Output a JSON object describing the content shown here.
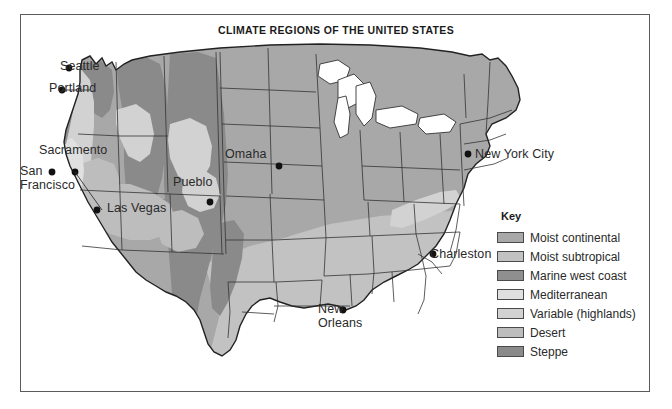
{
  "figure": {
    "title": "CLIMATE REGIONS OF THE UNITED STATES"
  },
  "legend": {
    "title": "Key",
    "items": [
      {
        "label": "Moist continental",
        "color": "#a8a8a8"
      },
      {
        "label": "Moist subtropical",
        "color": "#c2c2c2"
      },
      {
        "label": "Marine west coast",
        "color": "#8f8f8f"
      },
      {
        "label": "Mediterranean",
        "color": "#e0e0e0"
      },
      {
        "label": "Variable (highlands)",
        "color": "#d2d2d2"
      },
      {
        "label": "Desert",
        "color": "#bdbdbd"
      },
      {
        "label": "Steppe",
        "color": "#8a8a8a"
      }
    ]
  },
  "map": {
    "ocean_color": "#ffffff",
    "state_border_color": "#333333",
    "city_dot_color": "#111111",
    "cities": [
      {
        "name": "Seattle",
        "label": "Seattle",
        "label_x": 40,
        "label_y": 60,
        "dot_x": 49,
        "dot_y": 54
      },
      {
        "name": "Portland",
        "label": "Portland",
        "label_x": 29,
        "label_y": 82,
        "dot_x": 42,
        "dot_y": 76
      },
      {
        "name": "Sacramento",
        "label": "Sacramento",
        "label_x": 19,
        "label_y": 144,
        "dot_x": 55,
        "dot_y": 158
      },
      {
        "name": "San Francisco",
        "label": "San\nFrancisco",
        "label_x": 0,
        "label_y": 164,
        "dot_x": 32,
        "dot_y": 158
      },
      {
        "name": "Las Vegas",
        "label": "Las Vegas",
        "label_x": 87,
        "label_y": 202,
        "dot_x": 77,
        "dot_y": 196
      },
      {
        "name": "Pueblo",
        "label": "Pueblo",
        "label_x": 153,
        "label_y": 176,
        "dot_x": 190,
        "dot_y": 188
      },
      {
        "name": "Omaha",
        "label": "Omaha",
        "label_x": 205,
        "label_y": 148,
        "dot_x": 259,
        "dot_y": 152
      },
      {
        "name": "New York City",
        "label": "New York City",
        "label_x": 455,
        "label_y": 148,
        "dot_x": 448,
        "dot_y": 140
      },
      {
        "name": "Charleston",
        "label": "Charleston",
        "label_x": 410,
        "label_y": 248,
        "dot_x": 413,
        "dot_y": 240
      },
      {
        "name": "New Orleans",
        "label": "New\nOrleans",
        "label_x": 302,
        "label_y": 302,
        "dot_x": 323,
        "dot_y": 296
      }
    ]
  }
}
